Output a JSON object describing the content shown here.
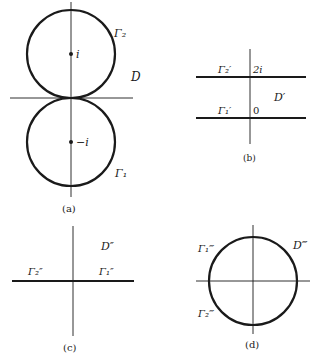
{
  "panels": {
    "a": {
      "caption": "(a)",
      "labels": {
        "gamma2": "Γ₂",
        "gamma1": "Γ₁",
        "region": "D",
        "point_top": "i",
        "point_bottom": "−i"
      }
    },
    "b": {
      "caption": "(b)",
      "labels": {
        "gamma2": "Γ₂′",
        "gamma1": "Γ₁′",
        "region": "D′",
        "tick_top": "2i",
        "tick_bottom": "0"
      }
    },
    "c": {
      "caption": "(c)",
      "labels": {
        "gamma2": "Γ₂″",
        "gamma1": "Γ₁″",
        "region": "D″"
      }
    },
    "d": {
      "caption": "(d)",
      "labels": {
        "gamma1": "Γ₁‴",
        "gamma2": "Γ₂‴",
        "region": "D‴"
      }
    }
  },
  "colors": {
    "ink": "#1a1a1a",
    "background": "#ffffff"
  }
}
